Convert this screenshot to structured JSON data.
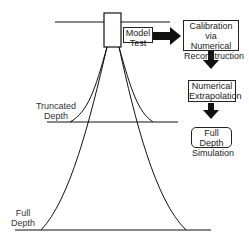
{
  "diagram": {
    "labels": {
      "truncated_depth": [
        "Truncated",
        "Depth"
      ],
      "full_depth": [
        "Full",
        "Depth"
      ]
    },
    "boxes": {
      "model_test": [
        "Model",
        "Test"
      ],
      "calibration": [
        "Calibration via",
        "Numerical",
        "Reconstruction"
      ],
      "extrapolation": [
        "Numerical",
        "Extrapolation"
      ],
      "full_depth_simulation": [
        "Full Depth",
        "Simulation"
      ]
    },
    "colors": {
      "stroke": "#111111",
      "background": "#ffffff"
    }
  }
}
